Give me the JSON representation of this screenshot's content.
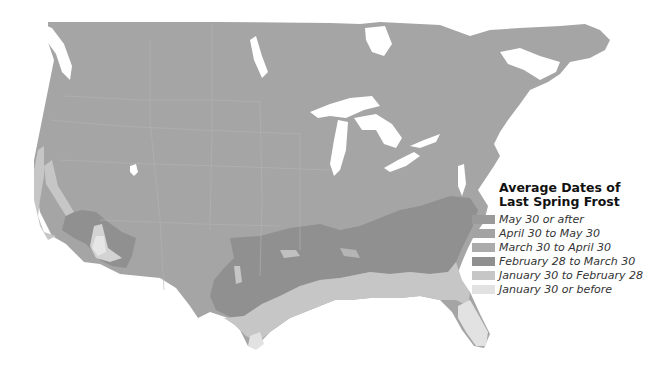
{
  "legend": {
    "title_line1": "Average Dates of",
    "title_line2": "Last Spring Frost",
    "items": [
      {
        "label": "May 30 or after",
        "color": "#9a9a9a"
      },
      {
        "label": "April 30 to May 30",
        "color": "#a3a3a3"
      },
      {
        "label": "March 30 to April 30",
        "color": "#ababab"
      },
      {
        "label": "February 28 to March 30",
        "color": "#8f8f8f"
      },
      {
        "label": "January 30 to February 28",
        "color": "#c6c6c6"
      },
      {
        "label": "January 30 or before",
        "color": "#e2e2e2"
      }
    ]
  },
  "map": {
    "region": "United States and southern Canada",
    "base_color": "#a5a5a5",
    "water_color": "#ffffff"
  }
}
